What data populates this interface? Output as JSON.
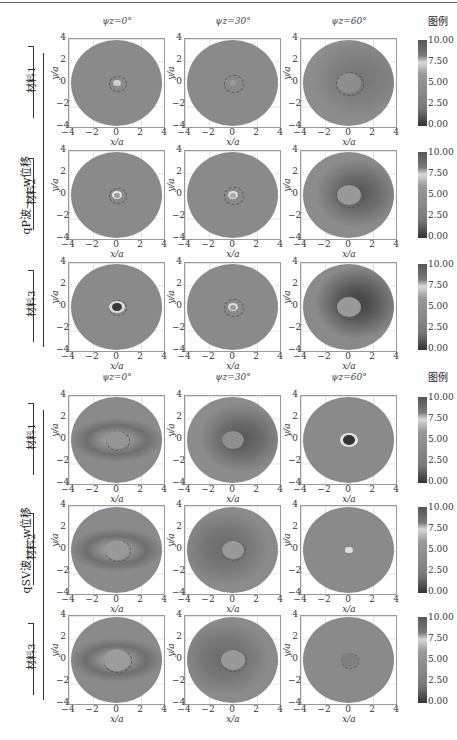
{
  "figure": {
    "sections": [
      {
        "label": "qP波——w位移",
        "materials": [
          "材料1",
          "材料2",
          "材料3"
        ]
      },
      {
        "label": "qSV波——w位移",
        "materials": [
          "材料1",
          "材料2",
          "材料3"
        ]
      }
    ],
    "column_titles": [
      "ψz=0°",
      "ψz=30°",
      "ψz=60°"
    ],
    "legend_title": "图例",
    "colorbar_ticks": [
      "10.00",
      "7.50",
      "5.00",
      "2.50",
      "0.00"
    ],
    "x_ticks": [
      "−4",
      "−2",
      "0",
      "2",
      "4"
    ],
    "y_ticks": [
      "4",
      "2",
      "0",
      "−2",
      "−4"
    ],
    "xlabel": "x/a",
    "ylabel": "y/a"
  },
  "chart_data": {
    "type": "heatmap",
    "title": "",
    "layout": "2 sections × 3 materials × 3 incidence angles (18 contour panels)",
    "xlabel": "x/a",
    "ylabel": "y/a",
    "xlim": [
      -4,
      4
    ],
    "ylim": [
      -4,
      4
    ],
    "x_ticks": [
      -4,
      -2,
      0,
      2,
      4
    ],
    "y_ticks": [
      -4,
      -2,
      0,
      2,
      4
    ],
    "colorbar": {
      "title": "图例",
      "range": [
        0,
        10
      ],
      "ticks": [
        0,
        2.5,
        5,
        7.5,
        10
      ]
    },
    "grid": true,
    "column_titles": [
      "ψz=0°",
      "ψz=30°",
      "ψz=60°"
    ],
    "row_labels": [
      "材料1",
      "材料2",
      "材料3"
    ],
    "section_labels": [
      "qP波——w位移",
      "qSV波——w位移"
    ],
    "panels": [
      {
        "section": "qP",
        "material": "材料1",
        "angle": "0°",
        "pattern": "uniform ~5, small bright spot at center"
      },
      {
        "section": "qP",
        "material": "材料1",
        "angle": "30°",
        "pattern": "uniform ~5, faint center"
      },
      {
        "section": "qP",
        "material": "材料1",
        "angle": "60°",
        "pattern": "darker ring right of cavity"
      },
      {
        "section": "qP",
        "material": "材料2",
        "angle": "0°",
        "pattern": "bright ring at center"
      },
      {
        "section": "qP",
        "material": "材料2",
        "angle": "30°",
        "pattern": "bright ring at center"
      },
      {
        "section": "qP",
        "material": "材料2",
        "angle": "60°",
        "pattern": "dark crescent right of cavity"
      },
      {
        "section": "qP",
        "material": "材料3",
        "angle": "0°",
        "pattern": "dark core with bright ring"
      },
      {
        "section": "qP",
        "material": "材料3",
        "angle": "30°",
        "pattern": "bright ring at center"
      },
      {
        "section": "qP",
        "material": "材料3",
        "angle": "60°",
        "pattern": "strong dark crescent right of cavity"
      },
      {
        "section": "qSV",
        "material": "材料1",
        "angle": "0°",
        "pattern": "darker horizontal lobes"
      },
      {
        "section": "qSV",
        "material": "材料1",
        "angle": "30°",
        "pattern": "dark region right of cavity"
      },
      {
        "section": "qSV",
        "material": "材料1",
        "angle": "60°",
        "pattern": "dark core with bright ring"
      },
      {
        "section": "qSV",
        "material": "材料2",
        "angle": "0°",
        "pattern": "horizontal dark lobes"
      },
      {
        "section": "qSV",
        "material": "材料2",
        "angle": "30°",
        "pattern": "lobes left of cavity"
      },
      {
        "section": "qSV",
        "material": "材料2",
        "angle": "60°",
        "pattern": "bright spot at center"
      },
      {
        "section": "qSV",
        "material": "材料3",
        "angle": "0°",
        "pattern": "horizontal dark lobes"
      },
      {
        "section": "qSV",
        "material": "材料3",
        "angle": "30°",
        "pattern": "dark lobe left of cavity"
      },
      {
        "section": "qSV",
        "material": "材料3",
        "angle": "60°",
        "pattern": "nearly uniform, slightly dark center"
      }
    ]
  }
}
